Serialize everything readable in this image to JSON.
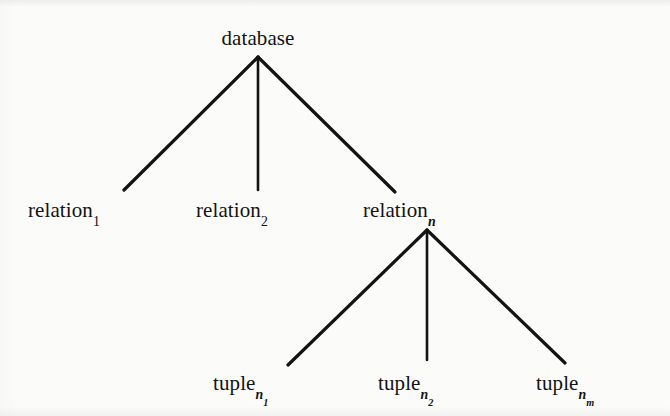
{
  "figure": {
    "type": "tree-diagram",
    "background_color": "#fbfbfa",
    "stroke_color": "#131313",
    "text_color": "#131313"
  },
  "nodes": {
    "root": {
      "id": "database",
      "label": "database",
      "subscript": "",
      "subsubscript": "",
      "x": 258,
      "y": 40,
      "level": 0
    },
    "level1": [
      {
        "id": "relation-1",
        "label": "relation",
        "subscript": "1",
        "subscript_italic": false,
        "subsubscript": "",
        "x": 96,
        "y": 215,
        "level": 1
      },
      {
        "id": "relation-2",
        "label": "relation",
        "subscript": "2",
        "subscript_italic": false,
        "subsubscript": "",
        "x": 258,
        "y": 215,
        "level": 1
      },
      {
        "id": "relation-n",
        "label": "relation",
        "subscript": "n",
        "subscript_italic": true,
        "subsubscript": "",
        "x": 427,
        "y": 215,
        "level": 1
      }
    ],
    "level2": [
      {
        "id": "tuple-n1",
        "label": "tuple",
        "subscript": "n",
        "subscript_italic": true,
        "subsubscript": "1",
        "subsubscript_italic": false,
        "x": 263,
        "y": 388,
        "level": 2
      },
      {
        "id": "tuple-n2",
        "label": "tuple",
        "subscript": "n",
        "subscript_italic": true,
        "subsubscript": "2",
        "subsubscript_italic": false,
        "x": 427,
        "y": 388,
        "level": 2
      },
      {
        "id": "tuple-nm",
        "label": "tuple",
        "subscript": "n",
        "subscript_italic": true,
        "subsubscript": "m",
        "subsubscript_italic": true,
        "x": 588,
        "y": 388,
        "level": 2
      }
    ]
  },
  "edges": [
    {
      "id": "edge-database-relation-1",
      "from": "database",
      "to": "relation-1",
      "x1": 258,
      "y1": 57,
      "x2": 124,
      "y2": 190
    },
    {
      "id": "edge-database-relation-2",
      "from": "database",
      "to": "relation-2",
      "x1": 258,
      "y1": 57,
      "x2": 258,
      "y2": 190
    },
    {
      "id": "edge-database-relation-n",
      "from": "database",
      "to": "relation-n",
      "x1": 258,
      "y1": 57,
      "x2": 395,
      "y2": 192
    },
    {
      "id": "edge-relation-n-tuple-n1",
      "from": "relation-n",
      "to": "tuple-n1",
      "x1": 427,
      "y1": 230,
      "x2": 288,
      "y2": 365
    },
    {
      "id": "edge-relation-n-tuple-n2",
      "from": "relation-n",
      "to": "tuple-n2",
      "x1": 427,
      "y1": 230,
      "x2": 427,
      "y2": 360
    },
    {
      "id": "edge-relation-n-tuple-nm",
      "from": "relation-n",
      "to": "tuple-nm",
      "x1": 427,
      "y1": 230,
      "x2": 565,
      "y2": 363
    }
  ]
}
